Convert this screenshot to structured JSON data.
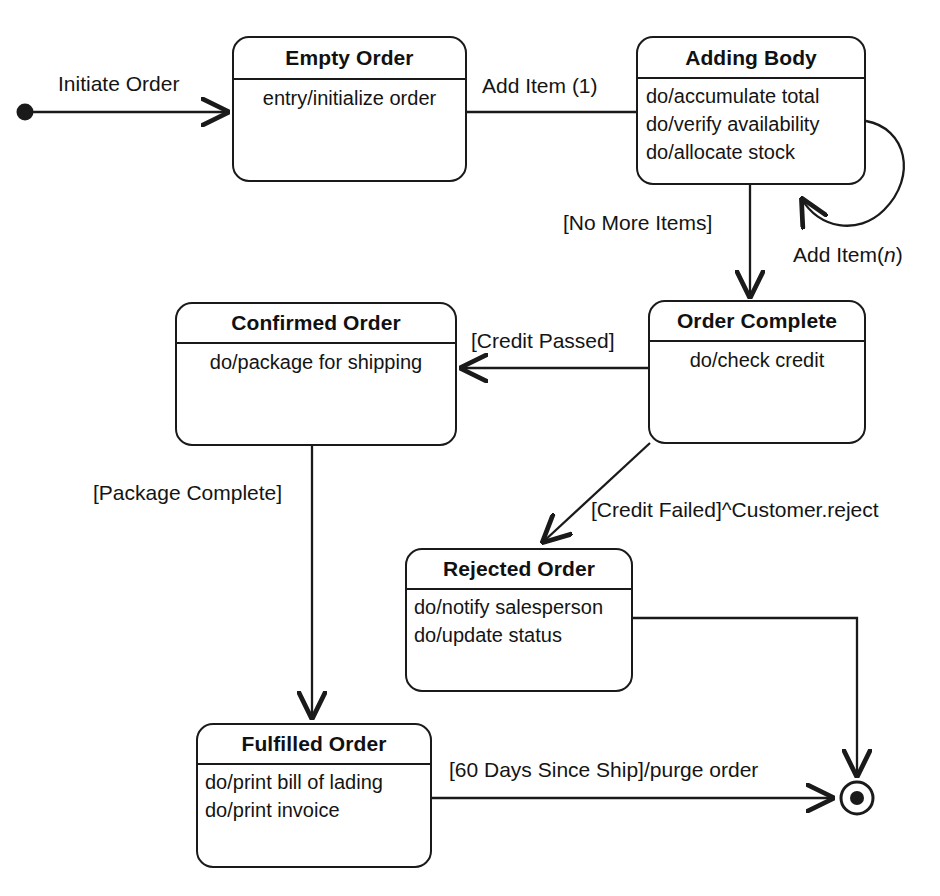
{
  "diagram": {
    "type": "uml-state-diagram",
    "stroke_color": "#1a1a1a",
    "text_color": "#141414",
    "background": "#ffffff"
  },
  "states": [
    {
      "id": "empty-order",
      "name": "Empty Order",
      "activities": [
        "entry/initialize order"
      ]
    },
    {
      "id": "adding-body",
      "name": "Adding Body",
      "activities": [
        "do/accumulate total",
        "do/verify availability",
        "do/allocate stock"
      ]
    },
    {
      "id": "order-complete",
      "name": "Order Complete",
      "activities": [
        "do/check credit"
      ]
    },
    {
      "id": "confirmed-order",
      "name": "Confirmed Order",
      "activities": [
        "do/package for shipping"
      ]
    },
    {
      "id": "rejected-order",
      "name": "Rejected Order",
      "activities": [
        "do/notify salesperson",
        "do/update status"
      ]
    },
    {
      "id": "fulfilled-order",
      "name": "Fulfilled Order",
      "activities": [
        "do/print bill of lading",
        "do/print invoice"
      ]
    }
  ],
  "pseudostates": [
    {
      "id": "initial-state",
      "kind": "initial"
    },
    {
      "id": "final-state",
      "kind": "final"
    }
  ],
  "transitions": [
    {
      "id": "t-initiate",
      "from": "initial-state",
      "to": "empty-order",
      "label": "Initiate Order"
    },
    {
      "id": "t-add-item-1",
      "from": "empty-order",
      "to": "adding-body",
      "label": "Add Item (1)"
    },
    {
      "id": "t-add-item-n",
      "from": "adding-body",
      "to": "adding-body",
      "label_prefix": "Add Item(",
      "label_italic": "n",
      "label_suffix": ")"
    },
    {
      "id": "t-no-more-items",
      "from": "adding-body",
      "to": "order-complete",
      "label": "[No More Items]"
    },
    {
      "id": "t-credit-passed",
      "from": "order-complete",
      "to": "confirmed-order",
      "label": "[Credit Passed]"
    },
    {
      "id": "t-credit-failed",
      "from": "order-complete",
      "to": "rejected-order",
      "label": "[Credit Failed]^Customer.reject"
    },
    {
      "id": "t-package-complete",
      "from": "confirmed-order",
      "to": "fulfilled-order",
      "label": "[Package Complete]"
    },
    {
      "id": "t-purge",
      "from": "fulfilled-order",
      "to": "final-state",
      "label": "[60 Days Since Ship]/purge order"
    },
    {
      "id": "t-rejected-end",
      "from": "rejected-order",
      "to": "final-state",
      "label": ""
    }
  ]
}
